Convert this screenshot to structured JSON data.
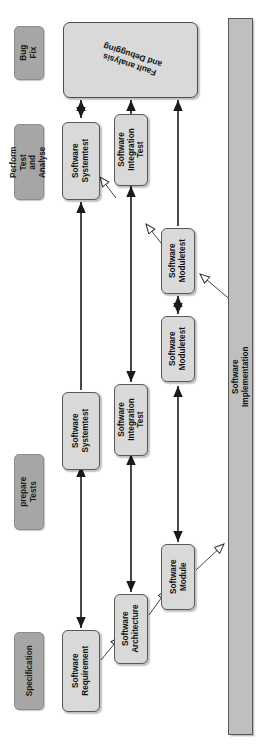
{
  "diagram": {
    "orientation": "rotated-90",
    "colors": {
      "phase_label_fill": "#a6a6a6",
      "process_box_fill": "#d9d9d9",
      "implementation_fill": "#bfbfbf",
      "stroke": "#595959",
      "text": "#111111",
      "background": "#ffffff"
    }
  },
  "phase_labels": [
    {
      "id": "bug-fix",
      "label": "Bug Fix"
    },
    {
      "id": "perform-test-and-analyse",
      "label": "Perform Test\nand Analyse"
    },
    {
      "id": "prepare-tests",
      "label": "prepare Tests"
    },
    {
      "id": "specification",
      "label": "Specification"
    }
  ],
  "fault_box": {
    "label": "Fault analysis\nand Debugging"
  },
  "implementation_bar": {
    "label": "Software Implementation"
  },
  "columns": [
    {
      "id": "column-1",
      "boxes": [
        {
          "id": "software-systemtest-perform",
          "label": "Software\nSystemtest"
        },
        {
          "id": "software-systemtest-prepare",
          "label": "Software\nSystemtest"
        },
        {
          "id": "software-requirement",
          "label": "Software\nRequirement"
        }
      ]
    },
    {
      "id": "column-2",
      "boxes": [
        {
          "id": "software-integration-test-perform",
          "label": "Software\nIntegration Test"
        },
        {
          "id": "software-integration-test-prepare",
          "label": "Software\nIntegration Test"
        },
        {
          "id": "software-architecture",
          "label": "Software\nArchitecture"
        }
      ]
    },
    {
      "id": "column-3",
      "boxes": [
        {
          "id": "software-moduletest-perform",
          "label": "Software\nModuletest"
        },
        {
          "id": "software-moduletest-prepare",
          "label": "Software\nModuletest"
        },
        {
          "id": "software-module",
          "label": "Software\nModule"
        }
      ]
    }
  ],
  "connections": [
    {
      "id": "conn-systemtest-fault",
      "type": "double-arrow"
    },
    {
      "id": "conn-integrationtest-fault",
      "type": "arrow"
    },
    {
      "id": "conn-moduletest-fault",
      "type": "arrow"
    },
    {
      "id": "conn-systemtest-prepare-perform",
      "type": "arrow"
    },
    {
      "id": "conn-integrationtest-prepare-perform",
      "type": "arrow"
    },
    {
      "id": "conn-moduletest-prepare-perform",
      "type": "double-arrow"
    },
    {
      "id": "conn-requirement-systemtest",
      "type": "double-arrow"
    },
    {
      "id": "conn-architecture-integrationtest",
      "type": "double-arrow"
    },
    {
      "id": "conn-module-moduletest",
      "type": "double-arrow"
    },
    {
      "id": "conn-requirement-architecture",
      "type": "refine"
    },
    {
      "id": "conn-architecture-module",
      "type": "refine"
    },
    {
      "id": "conn-module-implementation",
      "type": "refine"
    },
    {
      "id": "conn-implementation-moduletest",
      "type": "refine"
    },
    {
      "id": "conn-moduletest-integrationtest",
      "type": "refine"
    },
    {
      "id": "conn-integrationtest-systemtest",
      "type": "refine"
    }
  ]
}
